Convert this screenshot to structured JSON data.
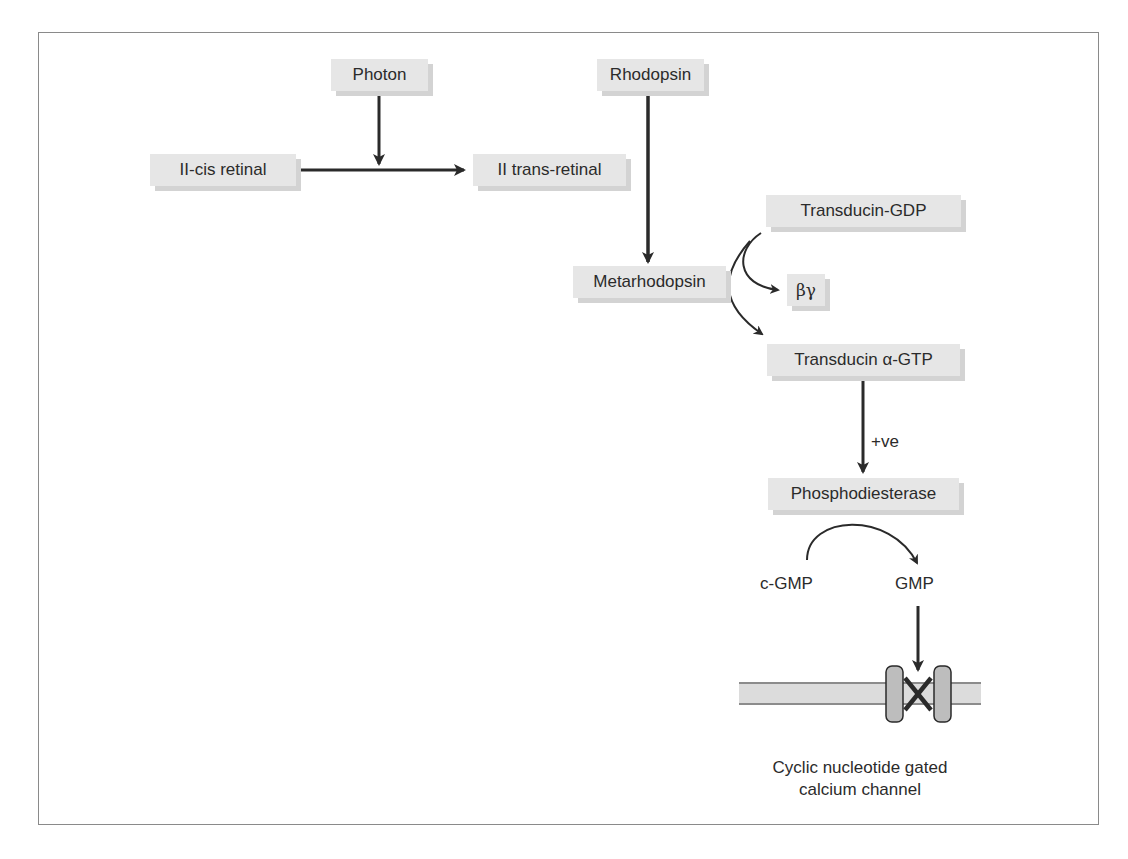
{
  "diagram": {
    "nodes": {
      "photon": "Photon",
      "rhodopsin": "Rhodopsin",
      "cis_retinal": "II-cis retinal",
      "trans_retinal": "II trans-retinal",
      "transducin_gdp": "Transducin-GDP",
      "metarhodopsin": "Metarhodopsin",
      "beta_gamma": "βγ",
      "transducin_gtp": "Transducin α-GTP",
      "phosphodiesterase": "Phosphodiesterase",
      "cgmp": "c-GMP",
      "gmp": "GMP"
    },
    "edge_labels": {
      "positive_effect": "+ve"
    },
    "channel_caption": {
      "line1": "Cyclic nucleotide gated",
      "line2": "calcium channel"
    },
    "colors": {
      "node_fill": "#e6e6e6",
      "node_shadow": "#d3d3d3",
      "arrow": "#2a2a2a",
      "membrane": "#dcdcdc",
      "channel": "#bdbdbd",
      "frame": "#8a8a8a"
    }
  }
}
